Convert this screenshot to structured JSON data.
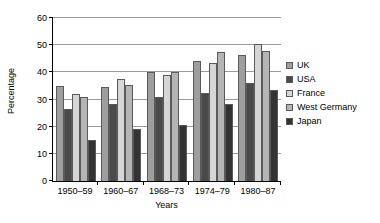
{
  "chart_data": {
    "type": "bar",
    "title": "",
    "subtitle": "",
    "xlabel": "Years",
    "ylabel": "Percentage",
    "categories": [
      "1950–59",
      "1960–67",
      "1968–73",
      "1974–79",
      "1980–87"
    ],
    "series": [
      {
        "name": "UK",
        "color": "#9e9e9e",
        "values": [
          35.0,
          34.5,
          40.0,
          44.0,
          46.5
        ]
      },
      {
        "name": "USA",
        "color": "#4a4a4a",
        "values": [
          26.5,
          28.5,
          31.0,
          32.5,
          36.0
        ]
      },
      {
        "name": "France",
        "color": "#d6d6d6",
        "values": [
          32.0,
          37.5,
          39.0,
          43.5,
          50.5
        ]
      },
      {
        "name": "West Germany",
        "color": "#b5b5b5",
        "values": [
          31.0,
          35.5,
          40.0,
          47.5,
          48.0
        ]
      },
      {
        "name": "Japan",
        "color": "#333333",
        "values": [
          15.0,
          19.0,
          20.5,
          28.5,
          33.5
        ]
      }
    ],
    "ylim": [
      0,
      60
    ],
    "ytick_step": 10,
    "yticks": [
      0,
      10,
      20,
      30,
      40,
      50,
      60
    ],
    "ytick_labels": [
      "0",
      "10",
      "20",
      "30",
      "40",
      "50",
      "60"
    ],
    "grid": true,
    "grid_axis": "y",
    "legend": true,
    "legend_position": "right",
    "axis_color": "#000000",
    "gridline_color": "#9a9a9a",
    "background": "#ffffff"
  }
}
